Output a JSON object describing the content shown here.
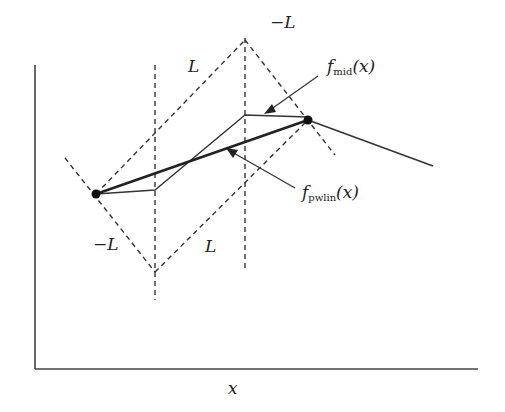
{
  "diagram": {
    "xlabel": "x",
    "labels": {
      "L_top": "L",
      "negL_top": "−L",
      "negL_bottom": "−L",
      "L_bottom": "L",
      "f_mid_base": "f",
      "f_mid_sub": "mid",
      "f_mid_arg": "(x)",
      "f_pwlin_base": "f",
      "f_pwlin_sub": "pwlin",
      "f_pwlin_arg": "(x)"
    },
    "points": {
      "left": [
        96,
        194
      ],
      "right": [
        308,
        120
      ]
    },
    "colors": {
      "line": "#333333",
      "background": "#ffffff"
    }
  }
}
